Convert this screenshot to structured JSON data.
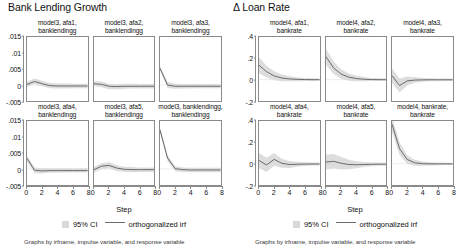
{
  "figures": [
    {
      "id": "bank-lending-growth",
      "title": "Bank Lending Growth",
      "xlabel": "Step",
      "caption": "Graphs by irfname, impulse variable, and response variable",
      "legend": {
        "band": "95% CI",
        "line": "orthogonalized irf"
      },
      "yticks": [
        ".015",
        ".01",
        ".005",
        "0",
        "-.005"
      ],
      "xticks": [
        "0",
        "2",
        "4",
        "6",
        "8"
      ],
      "panels": [
        {
          "title": "model3, afa1,\nbanklendingg"
        },
        {
          "title": "model3, afa2,\nbanklendingg"
        },
        {
          "title": "model3, afa3,\nbanklendingg"
        },
        {
          "title": "model3, afa4,\nbanklendingg"
        },
        {
          "title": "model3, afa5,\nbanklendingg"
        },
        {
          "title": "model3, banklendingg,\nbanklendingg"
        }
      ]
    },
    {
      "id": "delta-loan-rate",
      "title": "Δ Loan Rate",
      "xlabel": "Step",
      "caption": "Graphs by irfname, impulse variable, and response variable",
      "legend": {
        "band": "95% CI",
        "line": "orthogonalized irf"
      },
      "yticks": [
        ".4",
        ".2",
        "0",
        "-.2"
      ],
      "xticks": [
        "0",
        "2",
        "4",
        "6",
        "8"
      ],
      "panels": [
        {
          "title": "model4, afa1,\nbankrate"
        },
        {
          "title": "model4, afa2,\nbankrate"
        },
        {
          "title": "model4, afa3,\nbankrate"
        },
        {
          "title": "model4, afa4,\nbankrate"
        },
        {
          "title": "model4, afa5,\nbankrate"
        },
        {
          "title": "model4, bankrate,\nbankrate"
        }
      ]
    }
  ],
  "colors": {
    "irf_line": "#6b6b6b",
    "ci_band": "#d9d9d9",
    "axis": "#8a8a8a",
    "text": "#111111"
  },
  "chart_data": [
    {
      "type": "line",
      "title": "Bank Lending Growth",
      "xlabel": "Step",
      "ylabel": "",
      "xlim": [
        0,
        8
      ],
      "ylim": [
        -0.005,
        0.015
      ],
      "grid": false,
      "legend_position": "bottom",
      "x": [
        0,
        1,
        2,
        3,
        4,
        5,
        6,
        7,
        8
      ],
      "panels": [
        {
          "name": "model3, afa1, banklendingg",
          "irf": [
            0.0002,
            0.0011,
            0.0004,
            -0.0002,
            -0.0003,
            -0.0003,
            -0.0003,
            -0.0003,
            -0.0003
          ],
          "ci_lower": [
            -0.0006,
            0.0003,
            -0.0004,
            -0.001,
            -0.0011,
            -0.0011,
            -0.001,
            -0.001,
            -0.001
          ],
          "ci_upper": [
            0.001,
            0.002,
            0.0013,
            0.0006,
            0.0005,
            0.0005,
            0.0004,
            0.0004,
            0.0004
          ]
        },
        {
          "name": "model3, afa2, banklendingg",
          "irf": [
            0.0004,
            0.0002,
            -0.0004,
            -0.0005,
            -0.0004,
            -0.0004,
            -0.0004,
            -0.0004,
            -0.0004
          ],
          "ci_lower": [
            -0.0004,
            -0.0007,
            -0.0013,
            -0.0013,
            -0.0012,
            -0.0011,
            -0.0011,
            -0.0011,
            -0.0011
          ],
          "ci_upper": [
            0.0012,
            0.0011,
            0.0004,
            0.0003,
            0.0004,
            0.0004,
            0.0003,
            0.0003,
            0.0003
          ]
        },
        {
          "name": "model3, afa3, banklendingg",
          "irf": [
            0.0052,
            0.0,
            -0.0004,
            -0.0004,
            -0.0004,
            -0.0004,
            -0.0004,
            -0.0004,
            -0.0004
          ],
          "ci_lower": [
            0.0045,
            -0.0009,
            -0.0012,
            -0.0011,
            -0.0011,
            -0.001,
            -0.001,
            -0.001,
            -0.001
          ],
          "ci_upper": [
            0.0059,
            0.0009,
            0.0004,
            0.0003,
            0.0003,
            0.0003,
            0.0003,
            0.0003,
            0.0003
          ]
        },
        {
          "name": "model3, afa4, banklendingg",
          "irf": [
            0.0033,
            -0.0004,
            -0.0006,
            -0.0005,
            -0.0005,
            -0.0005,
            -0.0005,
            -0.0005,
            -0.0005
          ],
          "ci_lower": [
            0.0024,
            -0.0013,
            -0.0014,
            -0.0012,
            -0.0012,
            -0.0011,
            -0.0011,
            -0.0011,
            -0.0011
          ],
          "ci_upper": [
            0.0042,
            0.0005,
            0.0002,
            0.0002,
            0.0002,
            0.0002,
            0.0002,
            0.0002,
            0.0002
          ]
        },
        {
          "name": "model3, afa5, banklendingg",
          "irf": [
            -0.0002,
            0.0009,
            0.0011,
            0.0003,
            -0.0001,
            -0.0002,
            -0.0002,
            -0.0002,
            -0.0002
          ],
          "ci_lower": [
            -0.0011,
            0.0,
            0.0002,
            -0.0006,
            -0.0009,
            -0.001,
            -0.0009,
            -0.0009,
            -0.0009
          ],
          "ci_upper": [
            0.0007,
            0.0018,
            0.0021,
            0.0012,
            0.0007,
            0.0006,
            0.0005,
            0.0005,
            0.0005
          ]
        },
        {
          "name": "model3, banklendingg, banklendingg",
          "irf": [
            0.0122,
            0.0034,
            0.0001,
            -0.0002,
            -0.0003,
            -0.0003,
            -0.0003,
            -0.0003,
            -0.0003
          ],
          "ci_lower": [
            0.0113,
            0.0025,
            -0.0007,
            -0.0009,
            -0.001,
            -0.001,
            -0.001,
            -0.001,
            -0.001
          ],
          "ci_upper": [
            0.0131,
            0.0043,
            0.0009,
            0.0005,
            0.0004,
            0.0004,
            0.0004,
            0.0004,
            0.0004
          ]
        }
      ]
    },
    {
      "type": "line",
      "title": "Δ Loan Rate",
      "xlabel": "Step",
      "ylabel": "",
      "xlim": [
        0,
        8
      ],
      "ylim": [
        -0.2,
        0.4
      ],
      "grid": false,
      "legend_position": "bottom",
      "x": [
        0,
        1,
        2,
        3,
        4,
        5,
        6,
        7,
        8
      ],
      "panels": [
        {
          "name": "model4, afa1, bankrate",
          "irf": [
            0.135,
            0.075,
            0.035,
            0.016,
            0.007,
            0.003,
            0.001,
            0.0,
            0.0
          ],
          "ci_lower": [
            0.06,
            0.02,
            -0.005,
            -0.014,
            -0.016,
            -0.015,
            -0.013,
            -0.012,
            -0.012
          ],
          "ci_upper": [
            0.21,
            0.13,
            0.078,
            0.048,
            0.031,
            0.022,
            0.016,
            0.013,
            0.012
          ]
        },
        {
          "name": "model4, afa2, bankrate",
          "irf": [
            0.215,
            0.11,
            0.052,
            0.024,
            0.01,
            0.004,
            0.001,
            0.0,
            0.0
          ],
          "ci_lower": [
            0.14,
            0.052,
            0.008,
            -0.01,
            -0.015,
            -0.015,
            -0.013,
            -0.012,
            -0.012
          ],
          "ci_upper": [
            0.29,
            0.17,
            0.098,
            0.058,
            0.036,
            0.024,
            0.016,
            0.013,
            0.012
          ]
        },
        {
          "name": "model4, afa3, bankrate",
          "irf": [
            0.038,
            -0.055,
            -0.012,
            -0.004,
            -0.002,
            -0.001,
            -0.001,
            -0.001,
            -0.001
          ],
          "ci_lower": [
            -0.03,
            -0.12,
            -0.055,
            -0.03,
            -0.02,
            -0.016,
            -0.014,
            -0.013,
            -0.013
          ],
          "ci_upper": [
            0.105,
            0.012,
            0.03,
            0.022,
            0.017,
            0.014,
            0.012,
            0.011,
            0.011
          ]
        },
        {
          "name": "model4, afa4, bankrate",
          "irf": [
            0.03,
            -0.012,
            0.04,
            0.004,
            -0.008,
            -0.006,
            -0.004,
            -0.003,
            -0.003
          ],
          "ci_lower": [
            -0.04,
            -0.078,
            -0.02,
            -0.038,
            -0.04,
            -0.03,
            -0.022,
            -0.018,
            -0.017
          ],
          "ci_upper": [
            0.1,
            0.055,
            0.1,
            0.046,
            0.024,
            0.018,
            0.014,
            0.012,
            0.011
          ]
        },
        {
          "name": "model4, afa5, bankrate",
          "irf": [
            0.015,
            0.022,
            0.004,
            -0.008,
            -0.01,
            -0.008,
            -0.006,
            -0.005,
            -0.005
          ],
          "ci_lower": [
            -0.055,
            -0.045,
            -0.055,
            -0.052,
            -0.042,
            -0.032,
            -0.024,
            -0.02,
            -0.018
          ],
          "ci_upper": [
            0.085,
            0.09,
            0.062,
            0.036,
            0.022,
            0.016,
            0.012,
            0.01,
            0.009
          ]
        },
        {
          "name": "model4, bankrate, bankrate",
          "irf": [
            0.37,
            0.14,
            0.04,
            0.008,
            0.0,
            -0.002,
            -0.002,
            -0.002,
            -0.002
          ],
          "ci_lower": [
            0.3,
            0.082,
            0.0,
            -0.02,
            -0.02,
            -0.018,
            -0.015,
            -0.013,
            -0.013
          ],
          "ci_upper": [
            0.44,
            0.198,
            0.08,
            0.036,
            0.02,
            0.014,
            0.011,
            0.009,
            0.009
          ]
        }
      ]
    }
  ]
}
